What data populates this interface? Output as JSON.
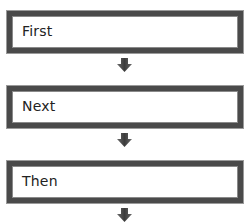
{
  "diagram": {
    "type": "vertical-flow",
    "steps": [
      {
        "label": "First"
      },
      {
        "label": "Next"
      },
      {
        "label": "Then"
      }
    ],
    "connectors": [
      {
        "icon": "down-arrow-icon"
      },
      {
        "icon": "down-arrow-icon"
      },
      {
        "icon": "down-arrow-icon"
      }
    ],
    "colors": {
      "border": "#4a4a4a",
      "arrow": "#505050",
      "text": "#222222",
      "background": "#ffffff"
    }
  }
}
